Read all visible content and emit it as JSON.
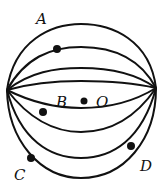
{
  "figure": {
    "type": "sphere with latitude-like arcs between two poles",
    "stroke_color": "#111111",
    "labels": {
      "A": "A",
      "B": "B",
      "O": "O",
      "C": "C",
      "D": "D"
    },
    "points": [
      {
        "name": "A-point",
        "label": "A"
      },
      {
        "name": "B-point",
        "label": "B"
      },
      {
        "name": "O-center",
        "label": "O"
      },
      {
        "name": "C-point",
        "label": "C"
      },
      {
        "name": "D-point",
        "label": "D"
      }
    ]
  }
}
